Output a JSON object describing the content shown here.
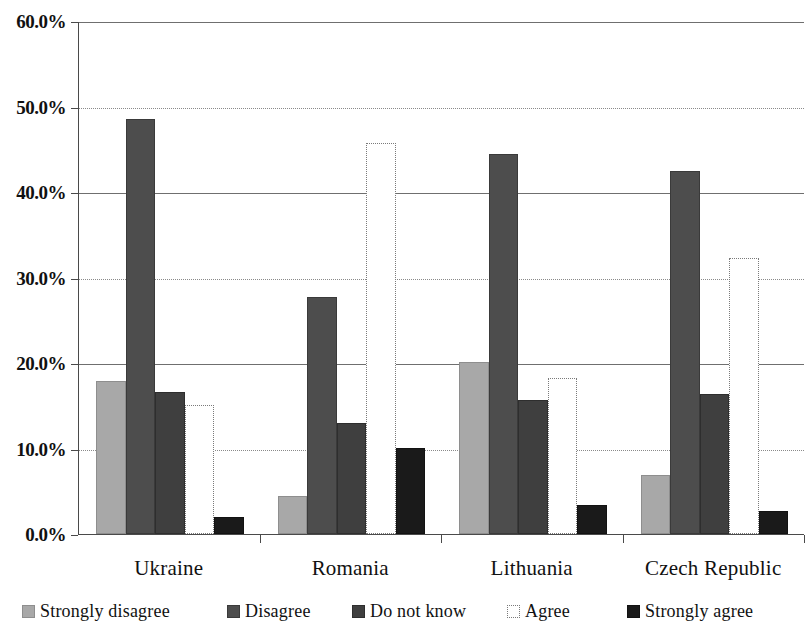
{
  "chart_data": {
    "type": "bar",
    "title": "",
    "xlabel": "",
    "ylabel": "",
    "ylim": [
      0,
      60
    ],
    "ytick_step": 10,
    "grid": true,
    "legend_position": "bottom",
    "categories": [
      "Ukraine",
      "Romania",
      "Lithuania",
      "Czech Republic"
    ],
    "ytick_labels": [
      "0.0%",
      "10.0%",
      "20.0%",
      "30.0%",
      "40.0%",
      "50.0%",
      "60.0%"
    ],
    "ytick_values": [
      0,
      10,
      20,
      30,
      40,
      50,
      60
    ],
    "series": [
      {
        "name": "Strongly disagree",
        "color": "#a8a8a8",
        "values": [
          17.9,
          4.4,
          20.1,
          6.9
        ]
      },
      {
        "name": "Disagree",
        "color": "#4d4d4d",
        "values": [
          48.5,
          27.7,
          44.4,
          42.5
        ]
      },
      {
        "name": "Do not know",
        "color": "#3f3f3f",
        "values": [
          16.6,
          13.0,
          15.7,
          16.4
        ]
      },
      {
        "name": "Agree",
        "color": "#ffffff",
        "values": [
          15.1,
          45.7,
          18.3,
          32.3
        ]
      },
      {
        "name": "Strongly agree",
        "color": "#1a1a1a",
        "values": [
          2.0,
          10.1,
          3.4,
          2.7
        ]
      }
    ]
  },
  "legend": {
    "items": [
      {
        "label": "Strongly disagree",
        "swatch": "sw-strongly-disagree"
      },
      {
        "label": "Disagree",
        "swatch": "sw-disagree"
      },
      {
        "label": "Do not know",
        "swatch": "sw-donotknow"
      },
      {
        "label": "Agree",
        "swatch": "sw-agree"
      },
      {
        "label": "Strongly agree",
        "swatch": "sw-strongly-agree"
      }
    ]
  }
}
